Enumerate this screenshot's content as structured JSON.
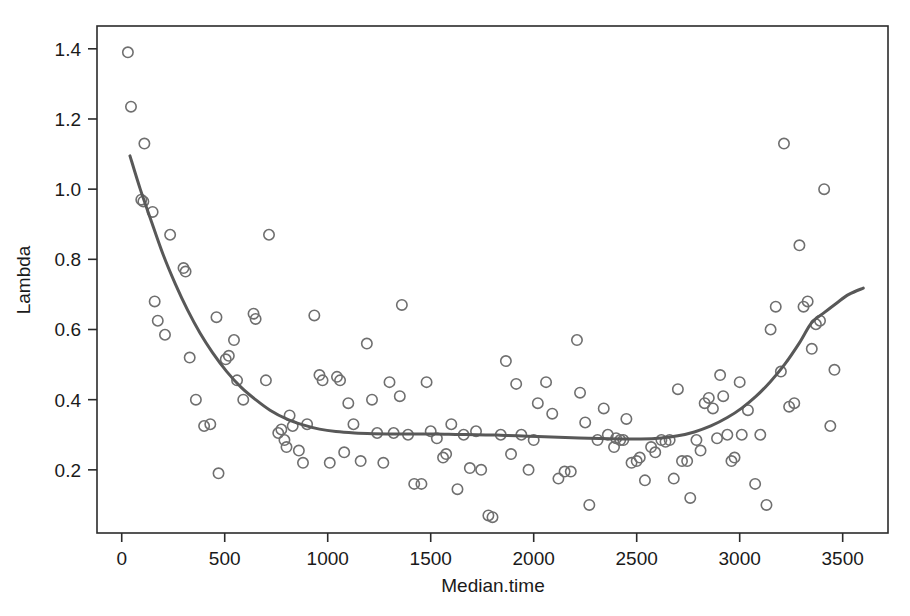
{
  "figure": {
    "width": 910,
    "height": 616,
    "background": "#ffffff"
  },
  "chart_data": {
    "type": "scatter",
    "title": "",
    "subtitle": "",
    "xlabel": "Median.time",
    "ylabel": "Lambda",
    "xlim": [
      -120,
      3720
    ],
    "ylim": [
      0.02,
      1.465
    ],
    "grid": false,
    "legend": null,
    "frame": true,
    "colors": {
      "marker_stroke": "#6f6f6f",
      "marker_fill": "none",
      "curve": "#585858",
      "axis": "#2b2b2b",
      "text": "#1a1a1a",
      "background": "#ffffff"
    },
    "marker": {
      "shape": "open-circle",
      "radius": 5.2,
      "stroke_width": 1.6
    },
    "xticks": [
      0,
      500,
      1000,
      1500,
      2000,
      2500,
      3000,
      3500
    ],
    "xtick_labels": [
      "0",
      "500",
      "1000",
      "1500",
      "2000",
      "2500",
      "3000",
      "3500"
    ],
    "yticks": [
      0.2,
      0.4,
      0.6,
      0.8,
      1.0,
      1.2,
      1.4
    ],
    "ytick_labels": [
      "0.2",
      "0.4",
      "0.6",
      "0.8",
      "1.0",
      "1.2",
      "1.4"
    ],
    "series": [
      {
        "name": "observations",
        "type": "scatter",
        "points": [
          [
            30,
            1.39
          ],
          [
            45,
            1.235
          ],
          [
            110,
            1.13
          ],
          [
            95,
            0.97
          ],
          [
            105,
            0.965
          ],
          [
            150,
            0.935
          ],
          [
            160,
            0.68
          ],
          [
            175,
            0.625
          ],
          [
            210,
            0.585
          ],
          [
            235,
            0.87
          ],
          [
            300,
            0.775
          ],
          [
            310,
            0.765
          ],
          [
            330,
            0.52
          ],
          [
            360,
            0.4
          ],
          [
            400,
            0.325
          ],
          [
            430,
            0.33
          ],
          [
            460,
            0.635
          ],
          [
            470,
            0.19
          ],
          [
            505,
            0.515
          ],
          [
            520,
            0.525
          ],
          [
            545,
            0.57
          ],
          [
            560,
            0.455
          ],
          [
            590,
            0.4
          ],
          [
            640,
            0.645
          ],
          [
            650,
            0.63
          ],
          [
            700,
            0.455
          ],
          [
            715,
            0.87
          ],
          [
            760,
            0.305
          ],
          [
            775,
            0.315
          ],
          [
            790,
            0.285
          ],
          [
            800,
            0.265
          ],
          [
            815,
            0.355
          ],
          [
            830,
            0.325
          ],
          [
            860,
            0.255
          ],
          [
            880,
            0.22
          ],
          [
            900,
            0.33
          ],
          [
            935,
            0.64
          ],
          [
            960,
            0.47
          ],
          [
            975,
            0.455
          ],
          [
            1010,
            0.22
          ],
          [
            1045,
            0.465
          ],
          [
            1060,
            0.455
          ],
          [
            1080,
            0.25
          ],
          [
            1100,
            0.39
          ],
          [
            1125,
            0.33
          ],
          [
            1160,
            0.225
          ],
          [
            1190,
            0.56
          ],
          [
            1215,
            0.4
          ],
          [
            1240,
            0.305
          ],
          [
            1270,
            0.22
          ],
          [
            1300,
            0.45
          ],
          [
            1320,
            0.305
          ],
          [
            1350,
            0.41
          ],
          [
            1360,
            0.67
          ],
          [
            1390,
            0.3
          ],
          [
            1420,
            0.16
          ],
          [
            1455,
            0.16
          ],
          [
            1480,
            0.45
          ],
          [
            1500,
            0.31
          ],
          [
            1530,
            0.29
          ],
          [
            1560,
            0.235
          ],
          [
            1575,
            0.245
          ],
          [
            1600,
            0.33
          ],
          [
            1630,
            0.145
          ],
          [
            1660,
            0.3
          ],
          [
            1690,
            0.205
          ],
          [
            1720,
            0.31
          ],
          [
            1745,
            0.2
          ],
          [
            1780,
            0.07
          ],
          [
            1800,
            0.065
          ],
          [
            1840,
            0.3
          ],
          [
            1865,
            0.51
          ],
          [
            1890,
            0.245
          ],
          [
            1915,
            0.445
          ],
          [
            1940,
            0.3
          ],
          [
            1975,
            0.2
          ],
          [
            2000,
            0.285
          ],
          [
            2020,
            0.39
          ],
          [
            2060,
            0.45
          ],
          [
            2090,
            0.36
          ],
          [
            2120,
            0.175
          ],
          [
            2150,
            0.195
          ],
          [
            2180,
            0.195
          ],
          [
            2210,
            0.57
          ],
          [
            2225,
            0.42
          ],
          [
            2250,
            0.335
          ],
          [
            2270,
            0.1
          ],
          [
            2310,
            0.285
          ],
          [
            2340,
            0.375
          ],
          [
            2360,
            0.3
          ],
          [
            2390,
            0.265
          ],
          [
            2400,
            0.29
          ],
          [
            2420,
            0.285
          ],
          [
            2435,
            0.285
          ],
          [
            2450,
            0.345
          ],
          [
            2475,
            0.22
          ],
          [
            2500,
            0.225
          ],
          [
            2515,
            0.235
          ],
          [
            2540,
            0.17
          ],
          [
            2570,
            0.265
          ],
          [
            2590,
            0.25
          ],
          [
            2620,
            0.285
          ],
          [
            2640,
            0.28
          ],
          [
            2660,
            0.285
          ],
          [
            2680,
            0.175
          ],
          [
            2700,
            0.43
          ],
          [
            2720,
            0.225
          ],
          [
            2745,
            0.225
          ],
          [
            2760,
            0.12
          ],
          [
            2790,
            0.285
          ],
          [
            2810,
            0.255
          ],
          [
            2830,
            0.39
          ],
          [
            2850,
            0.405
          ],
          [
            2870,
            0.375
          ],
          [
            2890,
            0.29
          ],
          [
            2905,
            0.47
          ],
          [
            2920,
            0.41
          ],
          [
            2940,
            0.3
          ],
          [
            2960,
            0.225
          ],
          [
            2975,
            0.235
          ],
          [
            3000,
            0.45
          ],
          [
            3010,
            0.3
          ],
          [
            3040,
            0.37
          ],
          [
            3075,
            0.16
          ],
          [
            3100,
            0.3
          ],
          [
            3130,
            0.1
          ],
          [
            3150,
            0.6
          ],
          [
            3175,
            0.665
          ],
          [
            3200,
            0.48
          ],
          [
            3215,
            1.13
          ],
          [
            3240,
            0.38
          ],
          [
            3265,
            0.39
          ],
          [
            3290,
            0.84
          ],
          [
            3310,
            0.665
          ],
          [
            3330,
            0.68
          ],
          [
            3350,
            0.545
          ],
          [
            3370,
            0.615
          ],
          [
            3390,
            0.625
          ],
          [
            3410,
            1.0
          ],
          [
            3440,
            0.325
          ],
          [
            3460,
            0.485
          ]
        ]
      },
      {
        "name": "loess-fit",
        "type": "line",
        "stroke": "#585858",
        "stroke_width": 3.0,
        "points": [
          [
            40,
            1.095
          ],
          [
            90,
            1.0
          ],
          [
            140,
            0.915
          ],
          [
            200,
            0.815
          ],
          [
            260,
            0.73
          ],
          [
            320,
            0.655
          ],
          [
            380,
            0.59
          ],
          [
            440,
            0.535
          ],
          [
            510,
            0.48
          ],
          [
            580,
            0.435
          ],
          [
            650,
            0.4
          ],
          [
            720,
            0.37
          ],
          [
            800,
            0.345
          ],
          [
            880,
            0.328
          ],
          [
            960,
            0.316
          ],
          [
            1040,
            0.309
          ],
          [
            1130,
            0.305
          ],
          [
            1220,
            0.303
          ],
          [
            1320,
            0.302
          ],
          [
            1420,
            0.302
          ],
          [
            1520,
            0.302
          ],
          [
            1620,
            0.301
          ],
          [
            1720,
            0.3
          ],
          [
            1820,
            0.299
          ],
          [
            1920,
            0.297
          ],
          [
            2020,
            0.295
          ],
          [
            2120,
            0.293
          ],
          [
            2220,
            0.291
          ],
          [
            2320,
            0.289
          ],
          [
            2420,
            0.288
          ],
          [
            2520,
            0.288
          ],
          [
            2620,
            0.291
          ],
          [
            2700,
            0.297
          ],
          [
            2780,
            0.308
          ],
          [
            2860,
            0.325
          ],
          [
            2940,
            0.349
          ],
          [
            3010,
            0.376
          ],
          [
            3080,
            0.41
          ],
          [
            3150,
            0.452
          ],
          [
            3220,
            0.502
          ],
          [
            3290,
            0.562
          ],
          [
            3350,
            0.62
          ],
          [
            3410,
            0.648
          ],
          [
            3470,
            0.675
          ],
          [
            3530,
            0.7
          ],
          [
            3600,
            0.718
          ]
        ]
      }
    ]
  },
  "axis_labels": {
    "x_title": "Median.time",
    "y_title": "Lambda"
  }
}
